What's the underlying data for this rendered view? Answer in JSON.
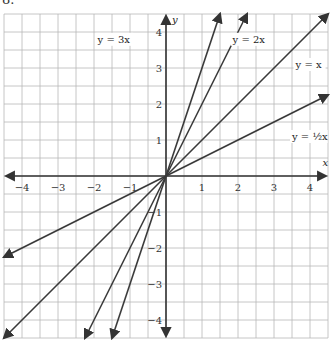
{
  "problem_number": "8.",
  "chart_data": {
    "type": "line",
    "title": "",
    "xlabel": "x",
    "ylabel": "y",
    "xlim": [
      -4.5,
      4.5
    ],
    "ylim": [
      -4.5,
      4.5
    ],
    "grid": true,
    "grid_step": 0.5,
    "x_ticks": [
      -4,
      -3,
      -2,
      -1,
      1,
      2,
      3,
      4
    ],
    "x_tick_labels": [
      "−4",
      "−3",
      "−2",
      "−1",
      "1",
      "2",
      "3",
      "4"
    ],
    "y_ticks": [
      -4,
      -3,
      -2,
      -1,
      1,
      2,
      3,
      4
    ],
    "y_tick_labels": [
      "−4",
      "−3",
      "−2",
      "−1",
      "1",
      "2",
      "3",
      "4"
    ],
    "origin_label": "0",
    "legend": "inline labels",
    "series": [
      {
        "name": "y = 3x",
        "slope": 3,
        "x": [
          -1.5,
          1.5
        ],
        "y": [
          -4.5,
          4.5
        ],
        "label_pos": [
          -1.9,
          3.7
        ]
      },
      {
        "name": "y = 2x",
        "slope": 2,
        "x": [
          -2.25,
          2.25
        ],
        "y": [
          -4.5,
          4.5
        ],
        "label_pos": [
          1.85,
          3.7
        ]
      },
      {
        "name": "y = x",
        "slope": 1,
        "x": [
          -4.5,
          4.5
        ],
        "y": [
          -4.5,
          4.5
        ],
        "label_pos": [
          3.6,
          3.0
        ]
      },
      {
        "name": "y = ½x",
        "slope": 0.5,
        "x": [
          -4.5,
          4.5
        ],
        "y": [
          -2.25,
          2.25
        ],
        "label_pos": [
          3.5,
          1.0
        ]
      }
    ]
  }
}
